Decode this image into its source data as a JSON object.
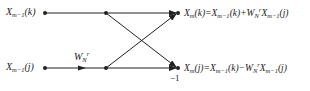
{
  "diagram": {
    "type": "butterfly",
    "inputs": {
      "top": {
        "base": "X",
        "sub": "m−1",
        "arg": "(k)"
      },
      "bottom": {
        "base": "X",
        "sub": "m−1",
        "arg": "(j)"
      }
    },
    "twiddle": {
      "base": "W",
      "sub": "N",
      "sup": "r"
    },
    "minus_one": "−1",
    "outputs": {
      "top": "X_m(k)=X_{m−1}(k)+W_N^r X_{m−1}(j)",
      "bottom": "X_m(j)=X_{m−1}(k)−W_N^r X_{m−1}(j)"
    },
    "colors": {
      "line": "#222222",
      "background": "#ffffff"
    }
  }
}
